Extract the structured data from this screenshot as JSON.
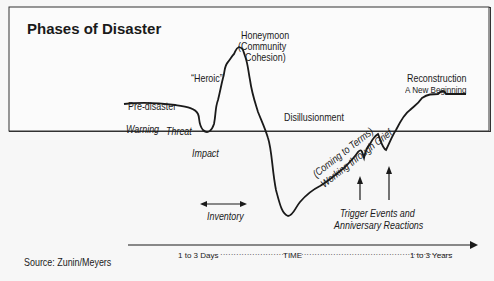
{
  "title": "Phases of Disaster",
  "phases": [
    {
      "label": "Pre-disaster"
    },
    {
      "label": "Warning"
    },
    {
      "label": "Threat"
    },
    {
      "label": "Impact"
    },
    {
      "label": "“Heroic”"
    },
    {
      "label": "Honeymoon",
      "sub1": "(Community",
      "sub2": "Cohesion)"
    },
    {
      "label": "Disillusionment"
    },
    {
      "label": "(Coming to Terms)",
      "sub1": "Working through Grief"
    },
    {
      "label": "Reconstruction",
      "sub1": "A New Beginning"
    }
  ],
  "annotations": {
    "inventory": "Inventory",
    "trigger_line1": "Trigger Events and",
    "trigger_line2": "Anniversary Reactions"
  },
  "time_axis": {
    "start": "1 to 3 Days",
    "middle": "TIME",
    "end": "1 to 3 Years"
  },
  "source": "Source: Zunin/Meyers"
}
